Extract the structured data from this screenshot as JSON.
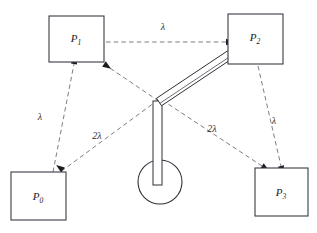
{
  "diagram": {
    "canvas": {
      "width": 317,
      "height": 233,
      "background": "#ffffff"
    },
    "colors": {
      "box_stroke": "#3a3a46",
      "dashed_edge": "#6d6d78",
      "arm_stroke": "#2f2f38",
      "text": "#1a1a1a",
      "arrow_fill": "#1b1b22"
    },
    "stations": [
      {
        "id": "P0",
        "name": "P0",
        "base": "P",
        "subscript": "0",
        "x": 11,
        "y": 172,
        "w": 55,
        "h": 48,
        "label_x": 38,
        "label_y": 200
      },
      {
        "id": "P1",
        "name": "P1",
        "base": "P",
        "subscript": "1",
        "x": 49,
        "y": 16,
        "w": 55,
        "h": 46,
        "label_x": 76,
        "label_y": 42
      },
      {
        "id": "P2",
        "name": "P2",
        "base": "P",
        "subscript": "2",
        "x": 228,
        "y": 14,
        "w": 55,
        "h": 50,
        "label_x": 255,
        "label_y": 41
      },
      {
        "id": "P3",
        "name": "P3",
        "base": "P",
        "subscript": "3",
        "x": 255,
        "y": 168,
        "w": 53,
        "h": 48,
        "label_x": 281,
        "label_y": 196
      }
    ],
    "edges": [
      {
        "id": "p1-to-p2",
        "from": "P1",
        "to": "P2",
        "label": "λ",
        "label_x": 163,
        "label_y": 30,
        "path": "M 106,42 L 226,42"
      },
      {
        "id": "p0-to-p1",
        "from": "P0",
        "to": "P1",
        "label": "λ",
        "label_x": 40,
        "label_y": 120,
        "path": "M 53,172 L 74,64"
      },
      {
        "id": "p0-to-robot",
        "from": "P0",
        "to": "robot-base",
        "label": "2λ",
        "label_x": 97,
        "label_y": 139,
        "path": "M 158,100 L 63,170"
      },
      {
        "id": "p1-to-robot",
        "from": "P1",
        "to": "robot-base",
        "label": "",
        "label_x": 0,
        "label_y": 0,
        "path": "M 104,64 L 163,104"
      },
      {
        "id": "robot-to-p3",
        "from": "robot-base",
        "to": "P3",
        "label": "2λ",
        "label_x": 212,
        "label_y": 132,
        "path": "M 162,100 L 262,166"
      },
      {
        "id": "p2-to-p3",
        "from": "P2",
        "to": "P3",
        "label": "λ",
        "label_x": 274,
        "label_y": 124,
        "path": "M 258,66 L 281,166"
      }
    ],
    "arrowheads": [
      {
        "id": "arrow-into-p2",
        "x": 226,
        "y": 42,
        "angle": 0
      },
      {
        "id": "arrow-into-p1",
        "x": 74,
        "y": 64,
        "angle": 281
      },
      {
        "id": "arrow-out-p1",
        "x": 104,
        "y": 64,
        "angle": 34
      },
      {
        "id": "arrow-into-p0",
        "x": 63,
        "y": 170,
        "angle": 216
      },
      {
        "id": "arrow-into-p3",
        "x": 281,
        "y": 166,
        "angle": 77
      },
      {
        "id": "arrow-into-p3b",
        "x": 262,
        "y": 166,
        "angle": 33
      }
    ],
    "robot": {
      "name": "robot-manipulator",
      "base_circle": {
        "cx": 160,
        "cy": 182,
        "r": 22
      },
      "column": {
        "x": 153,
        "y": 101,
        "w": 9,
        "h": 84
      },
      "arm": {
        "from_x": 159,
        "from_y": 102,
        "to_x": 243,
        "to_y": 46,
        "thickness": 9
      }
    },
    "edge_label_values": {
      "lambda": "λ",
      "two_lambda": "2λ"
    }
  }
}
